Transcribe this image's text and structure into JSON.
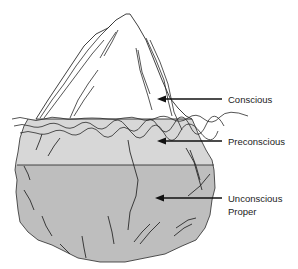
{
  "diagram": {
    "labels": [
      {
        "id": "conscious",
        "lines": [
          "Conscious"
        ]
      },
      {
        "id": "preconscious",
        "lines": [
          "Preconscious"
        ]
      },
      {
        "id": "unconscious",
        "lines": [
          "Unconscious",
          "Proper"
        ]
      }
    ],
    "colors": {
      "background": "#ffffff",
      "tip": "#ffffff",
      "preconscious_fill": "#d7d7d7",
      "unconscious_fill": "#bebebe",
      "outline": "#2a2a2a",
      "text": "#222222"
    }
  }
}
